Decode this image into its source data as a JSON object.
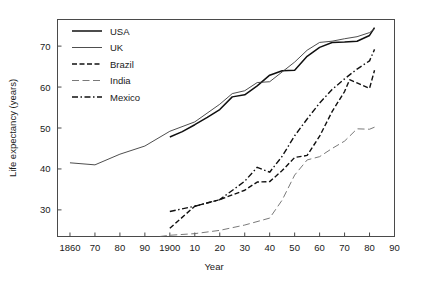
{
  "chart_data": {
    "type": "line",
    "title": "",
    "xlabel": "Year",
    "ylabel": "Life expectancy (years)",
    "xlim": [
      1855,
      1990
    ],
    "ylim": [
      23.5,
      76.5
    ],
    "grid": false,
    "legend_position": "top-left",
    "x_tick_values": [
      1860,
      1870,
      1880,
      1890,
      1900,
      1910,
      1920,
      1930,
      1940,
      1950,
      1960,
      1970,
      1980,
      1990
    ],
    "x_tick_labels": [
      "1860",
      "70",
      "80",
      "90",
      "1900",
      "10",
      "20",
      "30",
      "40",
      "50",
      "60",
      "70",
      "80",
      "90"
    ],
    "y_tick_values": [
      30,
      40,
      50,
      60,
      70
    ],
    "y_tick_labels": [
      "30",
      "40",
      "50",
      "60",
      "70"
    ],
    "series": [
      {
        "name": "USA",
        "style": "solid",
        "width": 1.5,
        "color": "#101010",
        "x": [
          1900,
          1905,
          1910,
          1915,
          1920,
          1925,
          1930,
          1935,
          1940,
          1945,
          1950,
          1955,
          1960,
          1965,
          1970,
          1975,
          1980,
          1982
        ],
        "y": [
          47.8,
          49.1,
          50.8,
          52.6,
          54.5,
          57.6,
          58.1,
          60.3,
          62.9,
          64.0,
          64.1,
          67.5,
          69.7,
          70.9,
          71.0,
          71.2,
          72.6,
          74.5
        ]
      },
      {
        "name": "UK",
        "style": "solid",
        "width": 0.9,
        "color": "#3a3a3a",
        "x": [
          1860,
          1870,
          1880,
          1890,
          1900,
          1910,
          1920,
          1925,
          1930,
          1935,
          1940,
          1945,
          1950,
          1955,
          1960,
          1965,
          1970,
          1975,
          1980,
          1982
        ],
        "y": [
          41.5,
          41.0,
          43.6,
          45.6,
          49.2,
          51.5,
          55.8,
          58.4,
          59.1,
          61.1,
          61.3,
          63.7,
          66.1,
          69.0,
          70.9,
          71.2,
          71.8,
          72.3,
          73.3,
          74.2
        ]
      },
      {
        "name": "Brazil",
        "style": "dashed",
        "width": 1.4,
        "color": "#101010",
        "x": [
          1900,
          1910,
          1920,
          1930,
          1935,
          1940,
          1945,
          1950,
          1955,
          1960,
          1965,
          1970,
          1972,
          1975,
          1980,
          1982
        ],
        "y": [
          25.5,
          30.9,
          32.5,
          34.8,
          36.8,
          36.9,
          39.6,
          42.8,
          43.3,
          48.0,
          54.0,
          58.9,
          61.8,
          61.0,
          59.7,
          64.1
        ]
      },
      {
        "name": "India",
        "style": "longdash",
        "width": 0.9,
        "color": "#6a6a6a",
        "x": [
          1896,
          1900,
          1910,
          1920,
          1930,
          1940,
          1945,
          1950,
          1955,
          1960,
          1965,
          1970,
          1975,
          1980,
          1982
        ],
        "y": [
          23.5,
          23.8,
          24.2,
          25.0,
          26.3,
          28.0,
          32.4,
          38.5,
          42.2,
          43.0,
          45.0,
          46.8,
          49.8,
          49.7,
          50.2
        ]
      },
      {
        "name": "Mexico",
        "style": "dashdot",
        "width": 1.4,
        "color": "#101010",
        "x": [
          1900,
          1910,
          1920,
          1930,
          1935,
          1940,
          1945,
          1950,
          1955,
          1960,
          1965,
          1970,
          1975,
          1980,
          1982
        ],
        "y": [
          29.6,
          30.9,
          32.5,
          37.0,
          40.4,
          39.2,
          43.1,
          48.1,
          52.2,
          56.1,
          59.4,
          62.0,
          64.4,
          66.4,
          69.2
        ]
      }
    ]
  },
  "legend": {
    "entries": [
      {
        "label": "USA"
      },
      {
        "label": "UK"
      },
      {
        "label": "Brazil"
      },
      {
        "label": "India"
      },
      {
        "label": "Mexico"
      }
    ]
  }
}
